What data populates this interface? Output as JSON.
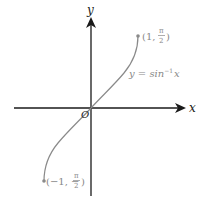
{
  "figure": {
    "function_label": "y = sin⁻¹ x",
    "function_label_parts": {
      "lhs": "y = sin",
      "sup": "−1",
      "var": "x"
    },
    "axes": {
      "x_label": "x",
      "y_label": "y",
      "origin_label": "O"
    },
    "endpoints": [
      {
        "name": "upper",
        "label_open": "(1, ",
        "num": "π",
        "den": "2",
        "label_close": ")",
        "x": 1,
        "y": "π/2"
      },
      {
        "name": "lower",
        "label_open": "(−1, −",
        "num": "π",
        "den": "2",
        "label_close": ")",
        "x": -1,
        "y": "-π/2"
      }
    ],
    "colors": {
      "axes": "#1a1a1a",
      "curve": "#8a8a8a",
      "labels": "#8a8a8a"
    }
  }
}
